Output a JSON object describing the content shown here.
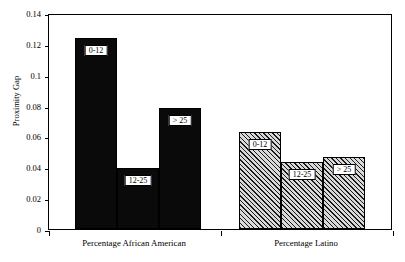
{
  "chart_data": {
    "type": "bar",
    "title": "",
    "xlabel": "",
    "ylabel": "Proximity Gap",
    "ylim": [
      0,
      0.14
    ],
    "yticks": [
      0,
      0.02,
      0.04,
      0.06,
      0.08,
      0.1,
      0.12,
      0.14
    ],
    "ytick_labels": [
      "0",
      "0.02",
      "0.04",
      "0.06",
      "0.08",
      "0.1",
      "0.12",
      "0.14"
    ],
    "grid": false,
    "legend": "none",
    "categories": [
      "0-12",
      "12-25",
      "> 25"
    ],
    "groups": [
      {
        "name": "Percentage African American",
        "fill": "solid-black",
        "bars": [
          {
            "label": "0-12",
            "value": 0.1235
          },
          {
            "label": "12-25",
            "value": 0.0397
          },
          {
            "label": "> 25",
            "value": 0.0786
          }
        ]
      },
      {
        "name": "Percentage Latino",
        "fill": "diagonal-hatch",
        "bars": [
          {
            "label": "0-12",
            "value": 0.0632
          },
          {
            "label": "12-25",
            "value": 0.0434
          },
          {
            "label": "> 25",
            "value": 0.0469
          }
        ]
      }
    ],
    "colors": {
      "african_american_bars": "#0a0a0a",
      "latino_bars": "#d9d9d9",
      "axis": "#000000",
      "background": "#ffffff"
    }
  },
  "axis": {
    "y_label": "Proximity Gap",
    "y_ticks": [
      "0.14",
      "0.12",
      "0.1",
      "0.08",
      "0.06",
      "0.04",
      "0.02",
      "0"
    ]
  },
  "group_labels": {
    "left": "Percentage African American",
    "right": "Percentage Latino"
  },
  "bar_labels": {
    "g1b1": "0-12",
    "g1b2": "12-25",
    "g1b3": "> 25",
    "g2b1": "0-12",
    "g2b2": "12-25",
    "g2b3": "> 25"
  }
}
